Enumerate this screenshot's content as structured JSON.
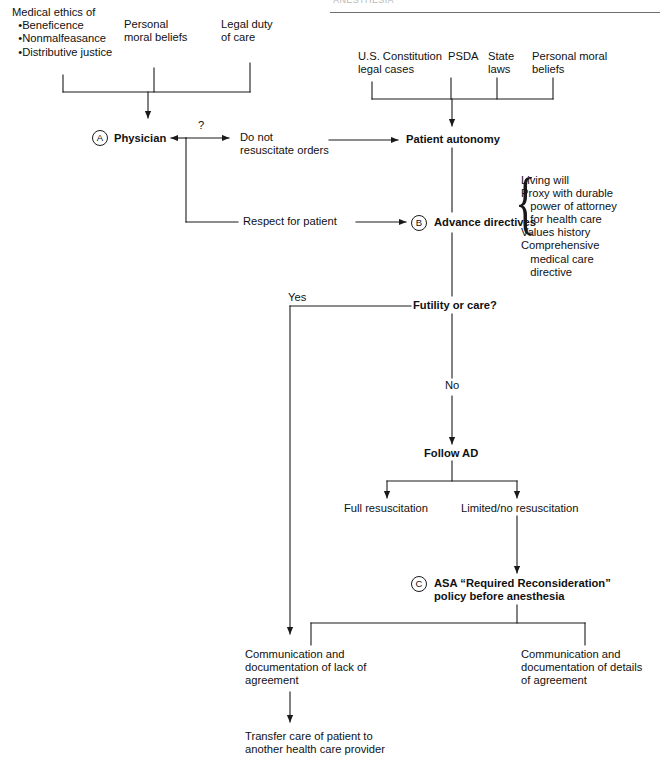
{
  "page": {
    "header_fragment": "ANESTHESIA"
  },
  "colors": {
    "line": "#1a1a1a",
    "text": "#111111",
    "rule": "#6f6f6f",
    "background": "#ffffff"
  },
  "markers": {
    "a": "A",
    "b": "B",
    "c": "C"
  },
  "nodes": {
    "medical_ethics": "Medical ethics of\n  •Beneficence\n  •Nonmalfeasance\n  •Distributive justice",
    "personal_moral_beliefs_left": "Personal\nmoral beliefs",
    "legal_duty": "Legal duty\nof care",
    "us_constitution": "U.S. Constitution\nlegal cases",
    "psda": "PSDA",
    "state_laws": "State\nlaws",
    "personal_moral_beliefs_right": "Personal moral\nbeliefs",
    "physician": "Physician",
    "question_mark": "?",
    "dnr_orders": "Do not\nresuscitate orders",
    "patient_autonomy": "Patient autonomy",
    "respect_for_patient": "Respect for patient",
    "advance_directives": "Advance directives",
    "ad_list": "Living will\nProxy with durable\n   power of attorney\n   for health care\nValues history\nComprehensive\n   medical care\n   directive",
    "futility_or_care": "Futility or care?",
    "yes_label": "Yes",
    "no_label": "No",
    "follow_ad": "Follow AD",
    "full_resuscitation": "Full resuscitation",
    "limited_no_resuscitation": "Limited/no resuscitation",
    "asa_policy": "ASA “Required Reconsideration”\npolicy before anesthesia",
    "comm_lack": "Communication and\ndocumentation of lack of\nagreement",
    "comm_details": "Communication and\ndocumentation of details\nof agreement",
    "transfer_care": "Transfer care of patient to\nanother health care provider"
  }
}
